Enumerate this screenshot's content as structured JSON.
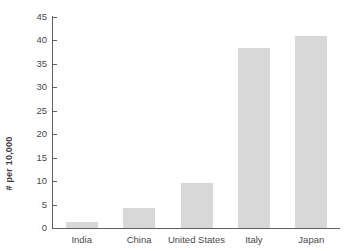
{
  "chart_data": {
    "type": "bar",
    "title": "",
    "xlabel": "",
    "ylabel": "# per 10,000",
    "categories": [
      "India",
      "China",
      "United States",
      "Italy",
      "Japan"
    ],
    "values": [
      1.2,
      4.2,
      9.5,
      38.3,
      41.0
    ],
    "ylim": [
      0,
      45
    ],
    "y_ticks": [
      0,
      5,
      10,
      15,
      20,
      25,
      30,
      35,
      40,
      45
    ],
    "y_tick_labels": [
      "0",
      "5",
      "10",
      "15",
      "20",
      "25",
      "30",
      "35",
      "40",
      "45"
    ],
    "grid": false,
    "legend": null,
    "legend_position": "none",
    "bar_color": "#d8d8d8",
    "axis_color": "#606060",
    "text_color": "#4a4a4a",
    "background": "#ffffff"
  }
}
